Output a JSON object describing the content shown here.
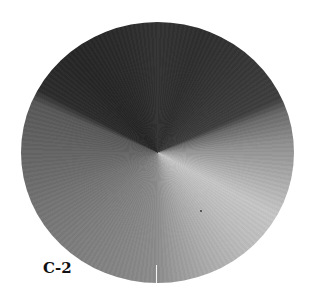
{
  "figure": {
    "label": "C-2",
    "colors": {
      "background": "#ffffff",
      "darkest_sector": "#262626",
      "lightest_sector": "#c6c6c6",
      "seam": "#f2f2f2",
      "label": "#111111"
    }
  }
}
